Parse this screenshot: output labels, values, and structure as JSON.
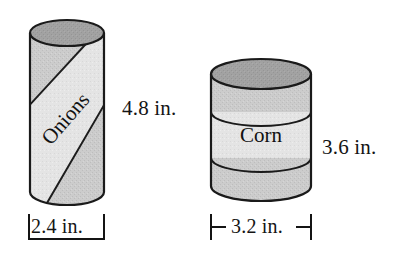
{
  "diagram": {
    "background_color": "#ffffff",
    "ink_color": "#141414"
  },
  "cans": [
    {
      "id": "onions-can",
      "product_label": "Onions",
      "label_orientation": "diagonal",
      "height_label": "4.8 in.",
      "diameter_label": "2.4 in.",
      "height_value": 4.8,
      "diameter_value": 2.4,
      "units": "in.",
      "body_color": "#c9c9c9",
      "top_color": "#9e9e9e",
      "band_color": "#e0e0e0",
      "outline_color": "#1a1a1a"
    },
    {
      "id": "corn-can",
      "product_label": "Corn",
      "label_orientation": "horizontal",
      "height_label": "3.6 in.",
      "diameter_label": "3.2 in.",
      "height_value": 3.6,
      "diameter_value": 3.2,
      "units": "in.",
      "body_color": "#c6c6c6",
      "top_color": "#999999",
      "band_color": "#eaeaea",
      "outline_color": "#1a1a1a"
    }
  ],
  "dimension_marks": {
    "onions_width_style": "bracket-ticks",
    "corn_width_style": "arrow-ticks"
  }
}
